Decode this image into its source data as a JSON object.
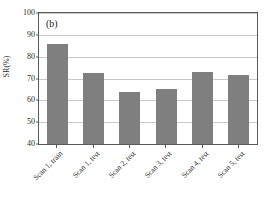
{
  "chart_data": {
    "type": "bar",
    "title": "",
    "panel_label": "(b)",
    "xlabel": "",
    "ylabel": "SR(%)",
    "categories": [
      "Scan 1, train",
      "Scan 1, test",
      "Scan 2, test",
      "Scan 3, test",
      "Scan 4, test",
      "Scan 5, test"
    ],
    "values": [
      86.0,
      72.5,
      64.0,
      65.2,
      72.8,
      71.5
    ],
    "ylim": [
      40,
      100
    ],
    "yticks": [
      40,
      50,
      60,
      70,
      80,
      90,
      100
    ],
    "ytick_labels": [
      "40",
      "50",
      "60",
      "70",
      "80",
      "90",
      "100"
    ],
    "grid": "horizontal",
    "legend": "none",
    "bar_color": "#7f7f7f",
    "grid_color": "#c9c9c9",
    "axis_color": "#595959",
    "background_color": "#ffffff"
  }
}
